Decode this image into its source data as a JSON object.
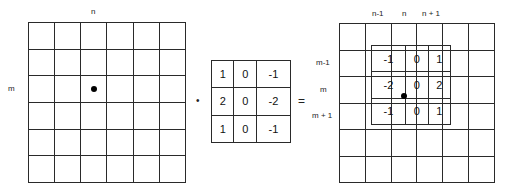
{
  "input_grid": {
    "rows": 6,
    "cols": 6,
    "col_label": "n",
    "row_label": "m",
    "marker": "center-dot"
  },
  "operator": "•",
  "kernel": {
    "rows": [
      [
        "1",
        "0",
        "-1"
      ],
      [
        "2",
        "0",
        "-2"
      ],
      [
        "1",
        "0",
        "-1"
      ]
    ]
  },
  "equals": "=",
  "output_grid": {
    "rows": 6,
    "cols": 6,
    "col_labels": [
      "n-1",
      "n",
      "n + 1"
    ],
    "row_labels": [
      "m-1",
      "m",
      "m + 1"
    ],
    "overlay_kernel": [
      [
        "-1",
        "0",
        "1"
      ],
      [
        "-2",
        "0",
        "2"
      ],
      [
        "-1",
        "0",
        "1"
      ]
    ],
    "marker": "center-dot"
  }
}
